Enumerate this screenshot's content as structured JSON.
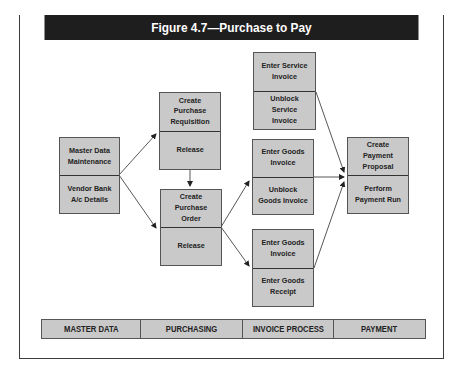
{
  "figure": {
    "title": "Figure 4.7—Purchase to Pay"
  },
  "boxes": {
    "master_data": {
      "top": "Master Data Maintenance",
      "bottom": "Vendor Bank A/c Details"
    },
    "requisition": {
      "top": "Create Purchase Requisition",
      "bottom": "Release"
    },
    "purchase_order": {
      "top": "Create Purchase Order",
      "bottom": "Release"
    },
    "service_invoice": {
      "top": "Enter Service Invoice",
      "bottom": "Unblock Service Invoice"
    },
    "goods_invoice": {
      "top": "Enter Goods Invoice",
      "bottom": "Unblock Goods Invoice"
    },
    "goods_receipt": {
      "top": "Enter Goods Invoice",
      "bottom": "Enter Goods Receipt"
    },
    "payment": {
      "top": "Create Payment Proposal",
      "bottom": "Perform Payment Run"
    }
  },
  "phases": [
    "MASTER DATA",
    "PURCHASING",
    "INVOICE PROCESS",
    "PAYMENT"
  ],
  "colors": {
    "title_bar": "#1e1e1e",
    "box_fill": "#c9c9c9",
    "border": "#555555"
  }
}
